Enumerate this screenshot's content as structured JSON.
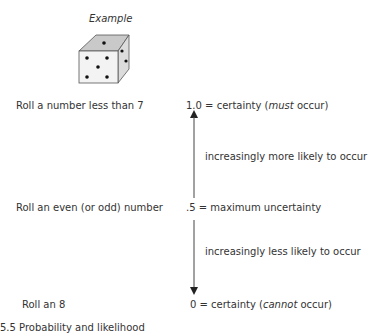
{
  "figure": {
    "example_label": "Example",
    "die": {
      "icon": "die-icon",
      "top_face_dots": 1,
      "front_face_dots": 5,
      "right_face_dots": 2,
      "colors": {
        "top": "#c9c9c9",
        "front": "#f3f3f3",
        "right": "#dcdcdc",
        "outline": "#555555",
        "dot": "#111111"
      }
    },
    "rows": [
      {
        "event": "Roll a number less than 7",
        "prob_value": "1.0",
        "prob_sep": " = certainty (",
        "prob_emph": "must",
        "prob_tail": " occur)"
      },
      {
        "event": "Roll an even (or odd) number",
        "prob_value": ".5",
        "prob_sep": " = maximum uncertainty",
        "prob_emph": "",
        "prob_tail": ""
      },
      {
        "event": "Roll an 8",
        "prob_value": "0",
        "prob_sep": " = certainty (",
        "prob_emph": "cannot",
        "prob_tail": " occur)"
      }
    ],
    "arrow_notes": {
      "up": "increasingly more likely to occur",
      "down": "increasingly less likely to occur"
    },
    "caption": "5.5  Probability and likelihood"
  }
}
